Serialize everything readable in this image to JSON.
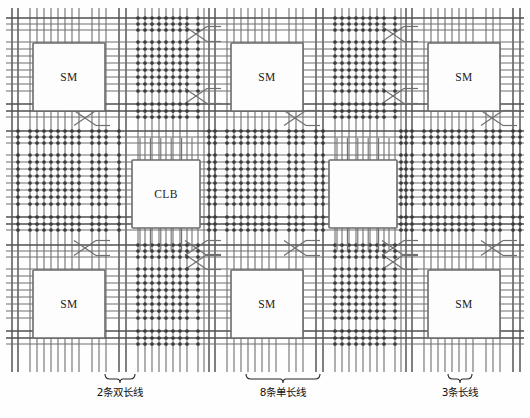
{
  "figure": {
    "kind": "fpga-routing-architecture-diagram",
    "width": 530,
    "height": 418,
    "background_color": "#ffffff",
    "line_color": "#6e6e6e",
    "pip_color": "#3a3a3a",
    "block_fill": "#fdfdfd",
    "block_stroke": "#6b6b6b"
  },
  "blocks": [
    {
      "id": "sm-r1-c1",
      "label": "SM",
      "type": "switch-matrix",
      "x": 33,
      "y": 43,
      "w": 72,
      "h": 68
    },
    {
      "id": "sm-r1-c2",
      "label": "SM",
      "type": "switch-matrix",
      "x": 231,
      "y": 43,
      "w": 72,
      "h": 68
    },
    {
      "id": "sm-r1-c3",
      "label": "SM",
      "type": "switch-matrix",
      "x": 428,
      "y": 43,
      "w": 72,
      "h": 68
    },
    {
      "id": "clb-r2-c1",
      "label": "CLB",
      "type": "logic-block",
      "x": 132,
      "y": 160,
      "w": 68,
      "h": 68
    },
    {
      "id": "clb-r2-c2",
      "label": "",
      "type": "logic-block",
      "x": 329,
      "y": 160,
      "w": 68,
      "h": 68
    },
    {
      "id": "sm-r3-c1",
      "label": "SM",
      "type": "switch-matrix",
      "x": 33,
      "y": 270,
      "w": 72,
      "h": 68
    },
    {
      "id": "sm-r3-c2",
      "label": "SM",
      "type": "switch-matrix",
      "x": 231,
      "y": 270,
      "w": 72,
      "h": 68
    },
    {
      "id": "sm-r3-c3",
      "label": "SM",
      "type": "switch-matrix",
      "x": 428,
      "y": 270,
      "w": 72,
      "h": 68
    }
  ],
  "captions": [
    {
      "id": "cap-double",
      "text": "2条双长线",
      "x": 120,
      "y": 393,
      "brace_x": 120,
      "brace_y": 374,
      "brace_w": 30
    },
    {
      "id": "cap-single",
      "text": "8条单长线",
      "x": 283,
      "y": 393,
      "brace_x": 283,
      "brace_y": 374,
      "brace_w": 74
    },
    {
      "id": "cap-long",
      "text": "3条长线",
      "x": 460,
      "y": 393,
      "brace_x": 460,
      "brace_y": 374,
      "brace_w": 24
    }
  ],
  "routing": {
    "channel_pitch_x": 197,
    "channel_pitch_y": 113,
    "v_channel_origins": [
      12,
      209,
      406
    ],
    "h_channel_origins": [
      18,
      131,
      245
    ],
    "groups": {
      "double_lines": {
        "count": 2,
        "label": "2条双长线"
      },
      "single_lines": {
        "count": 8,
        "label": "8条单长线"
      },
      "long_lines": {
        "count": 3,
        "label": "3条长线"
      }
    }
  },
  "colors": {
    "wire": "#6e6e6e",
    "wire_dark": "#4f4f4f",
    "pip": "#3a3a3a",
    "text": "#111111"
  }
}
